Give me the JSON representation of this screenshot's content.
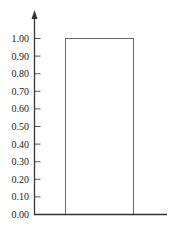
{
  "chart_data": {
    "type": "bar",
    "title": "",
    "xlabel": "",
    "ylabel": "",
    "categories": [
      ""
    ],
    "values": [
      1.0
    ],
    "ylim": [
      0,
      1.0
    ],
    "grid": false,
    "legend": null,
    "y_ticks": [
      "0.00",
      "0.10",
      "0.20",
      "0.30",
      "0.40",
      "0.50",
      "0.60",
      "0.70",
      "0.80",
      "0.90",
      "1.00"
    ],
    "bar_style": {
      "fill": "#ffffff",
      "stroke": "#666666"
    }
  },
  "axis": {
    "color": "#333333",
    "y_arrow": true
  }
}
